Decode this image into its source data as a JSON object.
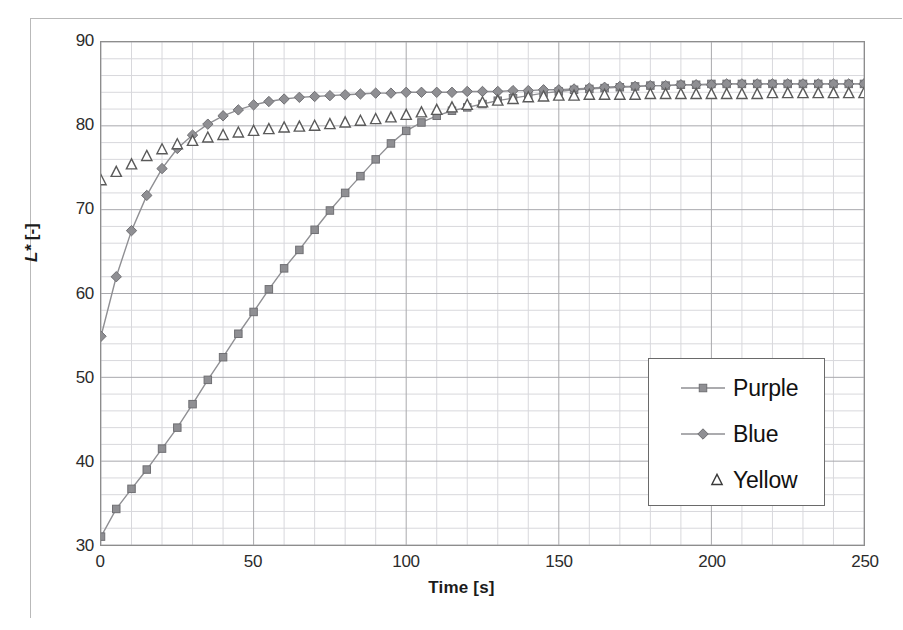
{
  "chart_data": {
    "type": "line",
    "title": "",
    "xlabel": "Time [s]",
    "ylabel_parts": {
      "symbol": "L*",
      "unit": "[-]"
    },
    "ylabel": "L* [-]",
    "xlim": [
      0,
      250
    ],
    "ylim": [
      30,
      90
    ],
    "x_major_ticks": [
      0,
      50,
      100,
      150,
      200,
      250
    ],
    "y_major_ticks": [
      30,
      40,
      50,
      60,
      70,
      80,
      90
    ],
    "x_minor_step": 10,
    "y_minor_step": 2,
    "grid": true,
    "legend_position": "inside-right",
    "x": [
      0,
      5,
      10,
      15,
      20,
      25,
      30,
      35,
      40,
      45,
      50,
      55,
      60,
      65,
      70,
      75,
      80,
      85,
      90,
      95,
      100,
      105,
      110,
      115,
      120,
      125,
      130,
      135,
      140,
      145,
      150,
      155,
      160,
      165,
      170,
      175,
      180,
      185,
      190,
      195,
      200,
      205,
      210,
      215,
      220,
      225,
      230,
      235,
      240,
      245,
      250
    ],
    "series": [
      {
        "name": "Purple",
        "marker": "square",
        "line": true,
        "color": "#8f8f93",
        "values": [
          31.0,
          34.3,
          36.7,
          39.0,
          41.5,
          44.0,
          46.8,
          49.7,
          52.4,
          55.2,
          57.8,
          60.5,
          63.0,
          65.2,
          67.6,
          69.9,
          72.0,
          74.0,
          76.0,
          77.9,
          79.4,
          80.4,
          81.2,
          81.8,
          82.2,
          82.6,
          83.0,
          83.3,
          83.6,
          83.9,
          84.1,
          84.3,
          84.4,
          84.5,
          84.6,
          84.7,
          84.8,
          84.8,
          84.9,
          84.9,
          85.0,
          85.0,
          85.0,
          85.0,
          85.0,
          85.0,
          85.0,
          85.0,
          85.0,
          85.0,
          85.0
        ]
      },
      {
        "name": "Blue",
        "marker": "diamond",
        "line": true,
        "color": "#8f8f93",
        "values": [
          54.9,
          62.0,
          67.5,
          71.7,
          74.9,
          77.3,
          78.9,
          80.2,
          81.2,
          81.9,
          82.5,
          82.9,
          83.2,
          83.4,
          83.5,
          83.6,
          83.7,
          83.8,
          83.9,
          83.9,
          84.0,
          84.0,
          84.0,
          84.0,
          84.1,
          84.1,
          84.1,
          84.2,
          84.2,
          84.3,
          84.3,
          84.4,
          84.5,
          84.6,
          84.7,
          84.7,
          84.8,
          84.8,
          84.9,
          84.9,
          84.9,
          85.0,
          85.0,
          85.0,
          85.0,
          85.0,
          85.0,
          85.0,
          85.0,
          85.0,
          85.0
        ]
      },
      {
        "name": "Yellow",
        "marker": "triangle",
        "line": false,
        "color": "#5a5a5a",
        "values": [
          73.5,
          74.5,
          75.4,
          76.4,
          77.2,
          77.8,
          78.2,
          78.6,
          78.9,
          79.2,
          79.4,
          79.6,
          79.8,
          79.9,
          80.0,
          80.2,
          80.4,
          80.6,
          80.8,
          81.0,
          81.3,
          81.6,
          81.9,
          82.2,
          82.5,
          82.8,
          83.0,
          83.2,
          83.4,
          83.5,
          83.6,
          83.6,
          83.7,
          83.7,
          83.7,
          83.7,
          83.8,
          83.8,
          83.8,
          83.8,
          83.8,
          83.8,
          83.8,
          83.8,
          83.9,
          83.9,
          83.9,
          83.9,
          83.9,
          83.9,
          83.9
        ]
      }
    ],
    "legend": [
      {
        "label": "Purple",
        "marker": "square",
        "line": true
      },
      {
        "label": "Blue",
        "marker": "diamond",
        "line": true
      },
      {
        "label": "Yellow",
        "marker": "triangle",
        "line": false
      }
    ]
  },
  "colors": {
    "grid_minor": "#d8d8dc",
    "grid_major": "#a9a9ad",
    "axis": "#8d8d8d",
    "series_gray": "#8f8f93",
    "text": "#1b1b1b"
  }
}
